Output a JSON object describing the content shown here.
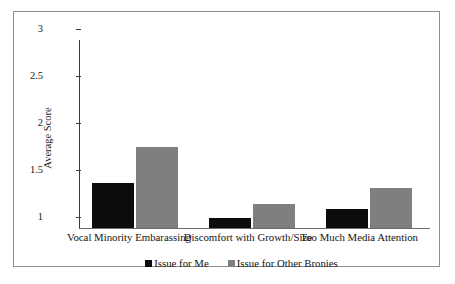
{
  "chart_data": {
    "type": "bar",
    "title": "",
    "subtitle": "",
    "xlabel": "",
    "ylabel": "Average Score",
    "ylim": [
      1,
      3
    ],
    "yticks": [
      "1",
      "1.5",
      "2",
      "2.5",
      "3"
    ],
    "ytick_values": [
      1,
      1.5,
      2,
      2.5,
      3
    ],
    "grid": false,
    "legend_position": "bottom-center",
    "categories": [
      "Vocal Minority Embarassing",
      "Discomfort with Growth/Size",
      "Too Much Media Attention"
    ],
    "series": [
      {
        "name": "Issue for Me",
        "color": "#0c0c0c",
        "values": [
          1.48,
          1.11,
          1.2
        ]
      },
      {
        "name": "Issue for Other Bronies",
        "color": "#7f7f7f",
        "values": [
          1.86,
          1.26,
          1.43
        ]
      }
    ],
    "annotations": []
  },
  "colors": {
    "series_me": "#0c0c0c",
    "series_others": "#7f7f7f",
    "axis": "#3b3b3b",
    "frame": "#8e8e8e",
    "background": "#ffffff"
  }
}
